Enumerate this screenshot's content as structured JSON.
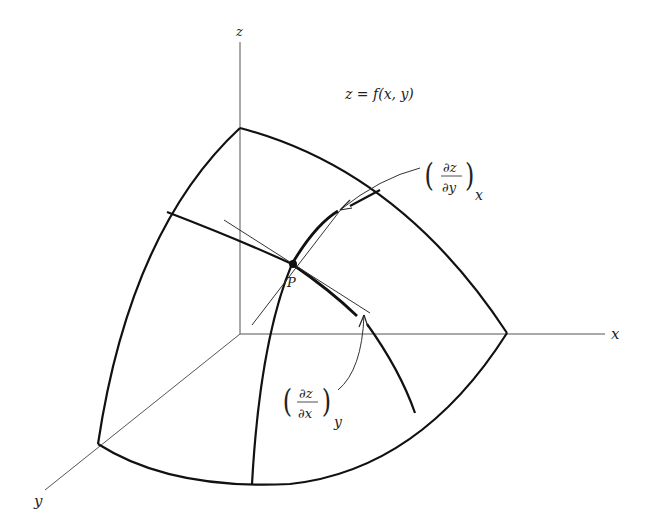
{
  "figure": {
    "type": "3D surface diagram with partial derivatives",
    "equation": "z = f(x,  y)",
    "axes": {
      "x_label": "x",
      "y_label": "y",
      "z_label": "z"
    },
    "point_label": "P",
    "annotations": {
      "dz_dy_x": {
        "numerator": "∂z",
        "denominator": "∂y",
        "subscript": "x",
        "paren_left": "(",
        "paren_right": ")"
      },
      "dz_dx_y": {
        "numerator": "∂z",
        "denominator": "∂x",
        "subscript": "y",
        "paren_left": "(",
        "paren_right": ")"
      }
    },
    "colors": {
      "line": "#111111",
      "axis": "#555555",
      "background": "#ffffff"
    }
  }
}
